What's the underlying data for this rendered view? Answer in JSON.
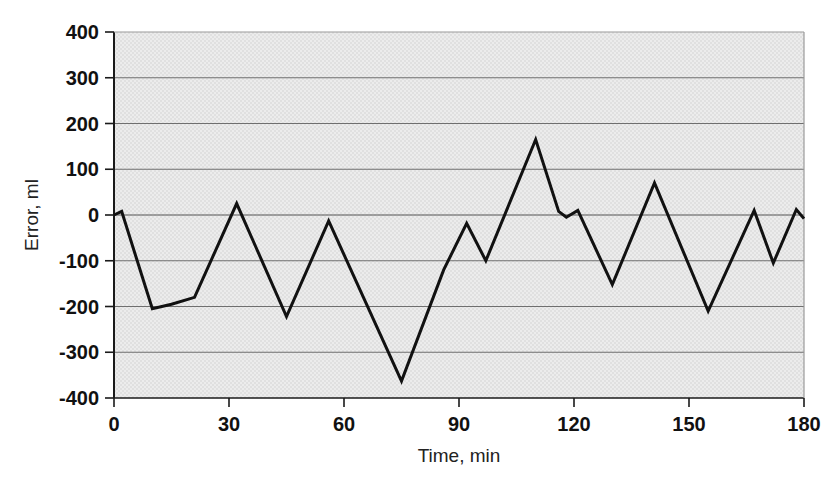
{
  "chart_data": {
    "type": "line",
    "title": "",
    "xlabel": "Time, min",
    "ylabel": "Error, ml",
    "xlim": [
      0,
      180
    ],
    "ylim": [
      -400,
      400
    ],
    "xticks": [
      0,
      30,
      60,
      90,
      120,
      150,
      180
    ],
    "yticks": [
      -400,
      -300,
      -200,
      -100,
      0,
      100,
      200,
      300,
      400
    ],
    "xtick_labels": [
      "0",
      "30",
      "60",
      "90",
      "120",
      "150",
      "180"
    ],
    "ytick_labels": [
      "-400",
      "-300",
      "-200",
      "-100",
      "0",
      "100",
      "200",
      "300",
      "400"
    ],
    "grid": true,
    "grid_axis": "y",
    "legend": false,
    "plot_background": "#e8e8e8",
    "line_color": "#111111",
    "line_width": 3,
    "series": [
      {
        "name": "Error",
        "x": [
          0,
          2,
          10,
          15,
          21,
          32,
          45,
          56,
          75,
          86,
          92,
          97,
          110,
          116,
          118,
          121,
          130,
          141,
          155,
          167,
          172,
          178,
          180
        ],
        "y": [
          0,
          8,
          -205,
          -195,
          -180,
          25,
          -222,
          -13,
          -363,
          -120,
          -18,
          -100,
          165,
          8,
          -5,
          10,
          -152,
          70,
          -210,
          10,
          -105,
          12,
          -8
        ]
      }
    ]
  }
}
